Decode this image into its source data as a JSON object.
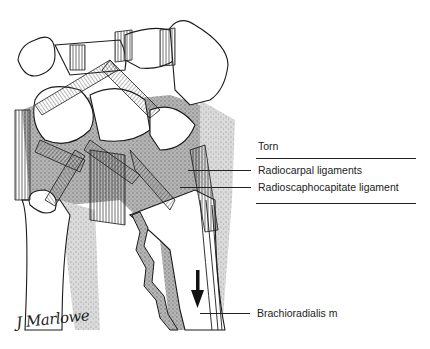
{
  "figure": {
    "signature": "J Marlowe"
  },
  "labels": {
    "torn": "Torn",
    "radiocarpal": "Radiocarpal ligaments",
    "radioscaphocapitate": "Radioscaphocapitate ligament",
    "brachioradialis": "Brachioradialis m"
  },
  "colors": {
    "ink": "#1a1a1a",
    "shading": "#8c8c8c",
    "bone": "#ffffff",
    "background": "#ffffff"
  }
}
